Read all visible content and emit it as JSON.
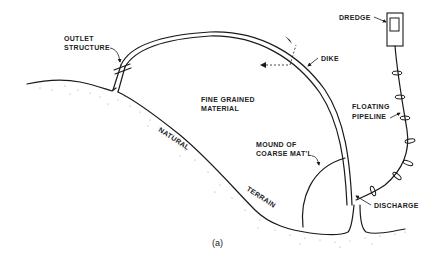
{
  "figure": {
    "caption": "(a)",
    "labels": {
      "outlet_structure_line1": "OUTLET",
      "outlet_structure_line2": "STRUCTURE",
      "dredge": "DREDGE",
      "dike": "DIKE",
      "fine_grained_line1": "FINE GRAINED",
      "fine_grained_line2": "MATERIAL",
      "floating_pipeline_line1": "FLOATING",
      "floating_pipeline_line2": "PIPELINE",
      "natural": "NATURAL",
      "terrain": "TERRAIN",
      "mound_line1": "MOUND OF",
      "mound_line2": "COARSE MAT'L",
      "discharge": "DISCHARGE"
    },
    "colors": {
      "ink": "#1a1a1a",
      "background": "#ffffff",
      "stipple": "#999999"
    }
  }
}
